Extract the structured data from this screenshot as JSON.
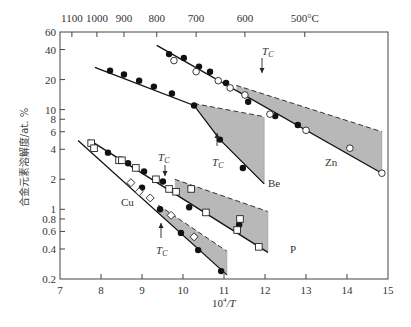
{
  "chart_data": {
    "type": "scatter",
    "title": "",
    "xlabel": "10^4/T",
    "ylabel": "合金元素溶解度/at.%",
    "xlim": [
      7,
      15
    ],
    "ylim": [
      0.2,
      60
    ],
    "yscale": "log",
    "x_ticks": [
      7,
      8,
      9,
      10,
      11,
      12,
      13,
      14,
      15
    ],
    "y_ticks": [
      0.2,
      0.4,
      0.6,
      0.8,
      1,
      2,
      4,
      6,
      8,
      10,
      20,
      40,
      60
    ],
    "top_axis": {
      "label_unit": "°C",
      "ticks": [
        {
          "label": "1100",
          "x": 7.29
        },
        {
          "label": "1000",
          "x": 7.9
        },
        {
          "label": "900",
          "x": 8.56
        },
        {
          "label": "800",
          "x": 9.36
        },
        {
          "label": "700",
          "x": 10.32
        },
        {
          "label": "600",
          "x": 11.51
        },
        {
          "label": "500°C",
          "x": 12.97
        }
      ]
    },
    "grid": false,
    "annotations": [
      "T_C (Zn, ~11.3)",
      "T_C (Be, ~10.6)",
      "T_C (P, ~9.7)",
      "T_C (Cu, ~9.4)"
    ],
    "series": [
      {
        "name": "Zn",
        "filled": [
          [
            9.66,
            36.0
          ],
          [
            10.02,
            33.0
          ],
          [
            10.39,
            27.0
          ],
          [
            10.66,
            24.0
          ],
          [
            11.05,
            18.5
          ],
          [
            11.59,
            12.0
          ],
          [
            12.25,
            8.6
          ],
          [
            12.8,
            7.0
          ]
        ],
        "open": [
          [
            9.78,
            31.0
          ],
          [
            10.32,
            24.0
          ],
          [
            10.86,
            19.5
          ],
          [
            11.15,
            16.5
          ],
          [
            11.51,
            14.0
          ],
          [
            12.12,
            9.0
          ],
          [
            13.0,
            6.2
          ],
          [
            14.07,
            4.1
          ],
          [
            14.85,
            2.3
          ]
        ],
        "lower_line": [
          [
            9.36,
            44
          ],
          [
            14.85,
            2.3
          ]
        ],
        "upper_dashed": [
          [
            11.3,
            17.5
          ],
          [
            14.85,
            6.0
          ]
        ]
      },
      {
        "name": "Be",
        "filled": [
          [
            8.22,
            24.5
          ],
          [
            8.56,
            22.5
          ],
          [
            8.93,
            19.5
          ],
          [
            9.29,
            17.0
          ],
          [
            9.73,
            14.5
          ],
          [
            10.27,
            11.0
          ],
          [
            10.9,
            5.0
          ],
          [
            11.46,
            2.6
          ]
        ],
        "open": [],
        "lower_line": [
          [
            7.85,
            26.5
          ],
          [
            10.27,
            11.0
          ],
          [
            10.9,
            5.0
          ],
          [
            11.98,
            1.8
          ]
        ],
        "upper_dashed": [
          [
            10.27,
            11.5
          ],
          [
            11.98,
            8.5
          ]
        ]
      },
      {
        "name": "P",
        "filled": [
          [
            8.17,
            3.7
          ],
          [
            8.66,
            2.9
          ],
          [
            9.05,
            2.4
          ],
          [
            9.51,
            1.9
          ],
          [
            10.15,
            1.05
          ],
          [
            11.37,
            0.7
          ]
        ],
        "open": [
          [
            7.76,
            4.6
          ],
          [
            7.83,
            4.1
          ],
          [
            8.44,
            3.1
          ],
          [
            8.51,
            3.1
          ],
          [
            8.85,
            2.6
          ],
          [
            9.34,
            2.0
          ],
          [
            9.66,
            1.6
          ],
          [
            9.83,
            1.5
          ],
          [
            10.2,
            1.6
          ],
          [
            10.56,
            0.93
          ],
          [
            11.32,
            0.62
          ],
          [
            11.39,
            0.8
          ],
          [
            11.85,
            0.42
          ]
        ],
        "lower_line": [
          [
            7.7,
            5.0
          ],
          [
            12.07,
            0.37
          ]
        ],
        "upper_dashed": [
          [
            9.8,
            2.0
          ],
          [
            12.07,
            0.95
          ]
        ]
      },
      {
        "name": "Cu",
        "filled": [
          [
            9.0,
            1.65
          ],
          [
            9.44,
            1.0
          ],
          [
            9.95,
            0.58
          ],
          [
            10.37,
            0.39
          ],
          [
            10.93,
            0.24
          ]
        ],
        "open": [
          [
            8.73,
            1.85
          ],
          [
            8.93,
            1.5
          ],
          [
            9.2,
            1.3
          ],
          [
            9.71,
            0.87
          ],
          [
            10.27,
            0.53
          ]
        ],
        "lower_line": [
          [
            7.44,
            4.9
          ],
          [
            11.07,
            0.22
          ]
        ],
        "upper_dashed": [
          [
            9.4,
            1.1
          ],
          [
            11.07,
            0.38
          ]
        ]
      }
    ]
  },
  "labels": {
    "zn": "Zn",
    "be": "Be",
    "p": "P",
    "cu": "Cu",
    "tc": "T",
    "tc_sub": "C",
    "xlabel_base": "10",
    "xlabel_exp": "4",
    "xlabel_tail": "/T",
    "ylabel": "合金元素溶解度/at. %",
    "top_unit": "°C"
  }
}
